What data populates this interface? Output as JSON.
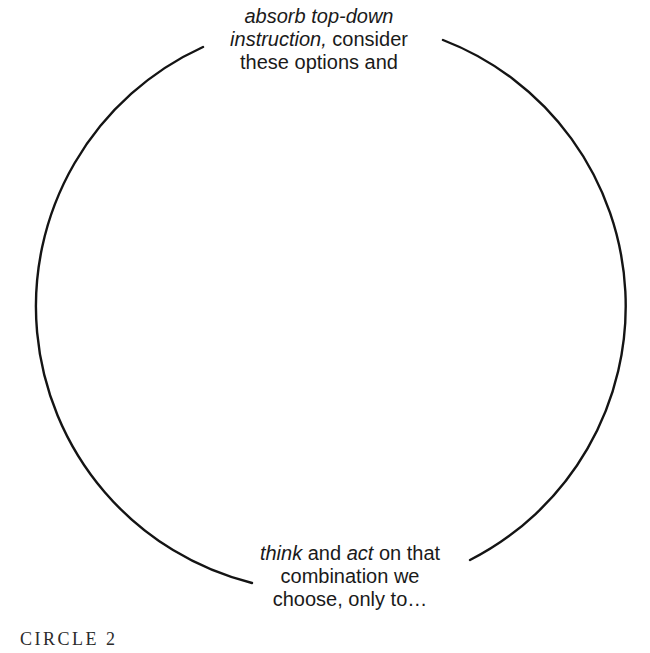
{
  "diagram": {
    "type": "circle-diagram",
    "caption": "CIRCLE 2",
    "top_label": {
      "l1_italic": "absorb top-down",
      "l2_italic": "instruction,",
      "l2_regular": " consider",
      "l3_regular": "these options and"
    },
    "bottom_label": {
      "l1_italic_1": "think",
      "l1_regular_1": " and ",
      "l1_italic_2": "act",
      "l1_regular_2": " on that",
      "l2_regular": "combination we",
      "l3_regular": "choose, only to…"
    },
    "colors": {
      "background": "#ffffff",
      "arc_stroke": "#141414",
      "label_text": "#1a1a1a",
      "caption_text": "#2b2b2b"
    }
  }
}
